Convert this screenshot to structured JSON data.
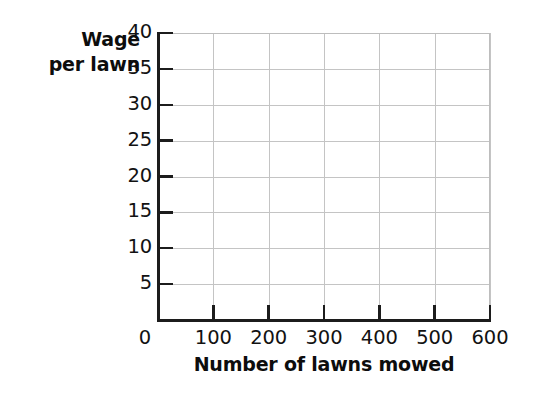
{
  "chart_data": {
    "type": "line",
    "title": "",
    "subtitle": "",
    "xlabel": "Number of lawns mowed",
    "ylabel": "Wage per lawn",
    "ylabel_lines": [
      "Wage",
      "per lawn"
    ],
    "x_ticks": [
      0,
      100,
      200,
      300,
      400,
      500,
      600
    ],
    "x_tick_labels": [
      "0",
      "100",
      "200",
      "300",
      "400",
      "500",
      "600"
    ],
    "y_ticks": [
      5,
      10,
      15,
      20,
      25,
      30,
      35,
      40
    ],
    "y_tick_labels": [
      "5",
      "10",
      "15",
      "20",
      "25",
      "30",
      "35",
      "40"
    ],
    "xlim": [
      0,
      600
    ],
    "ylim": [
      0,
      40
    ],
    "grid": true,
    "grid_color": "#c4c4c4",
    "axis_color": "#1c1c1c",
    "background_color": "#ffffff",
    "legend": null,
    "legend_position": "none",
    "series": [],
    "annotations": [],
    "note": "Empty coordinate grid provided for plotting; no data points, bars, or lines are drawn."
  }
}
